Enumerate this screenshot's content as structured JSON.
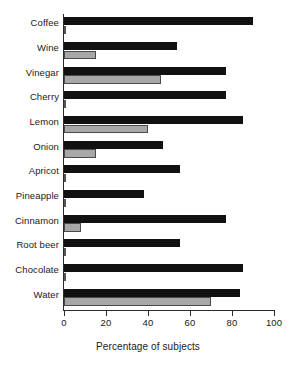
{
  "chart_data": {
    "type": "bar",
    "orientation": "horizontal",
    "title": "",
    "xlabel": "Percentage of subjects",
    "ylabel": "",
    "xlim": [
      0,
      100
    ],
    "xticks": [
      0,
      20,
      40,
      60,
      80,
      100
    ],
    "grid": false,
    "legend": null,
    "categories": [
      "Coffee",
      "Wine",
      "Vinegar",
      "Cherry",
      "Lemon",
      "Onion",
      "Apricot",
      "Pineapple",
      "Cinnamon",
      "Root beer",
      "Chocolate",
      "Water"
    ],
    "series": [
      {
        "name": "dark",
        "color": "#111111",
        "values": [
          90,
          54,
          77,
          77,
          85,
          47,
          55,
          38,
          77,
          55,
          85,
          84
        ]
      },
      {
        "name": "light",
        "color": "#a8a8a8",
        "values": [
          1,
          15,
          46,
          1,
          40,
          15,
          1,
          1,
          8,
          1,
          1,
          70
        ]
      }
    ]
  }
}
